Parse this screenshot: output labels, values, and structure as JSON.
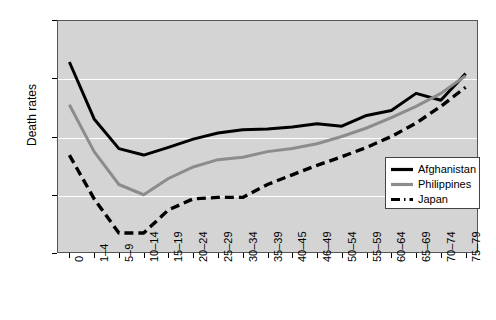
{
  "chart_data": {
    "type": "line",
    "title": "",
    "xlabel": "",
    "ylabel": "Death rates",
    "yscale": "log",
    "ylim": [
      0.1,
      1000
    ],
    "ytick_labels": [
      "1000",
      "100",
      "10",
      "1",
      "0.1"
    ],
    "ytick_values": [
      1000,
      100,
      10,
      1,
      0.1
    ],
    "grid": "horizontal",
    "legend_position": "lower right",
    "categories": [
      "0",
      "1–4",
      "5–9",
      "10–14",
      "15–19",
      "20–24",
      "25–29",
      "30–34",
      "35–39",
      "40–45",
      "46–49",
      "50–54",
      "55–59",
      "60–64",
      "65–69",
      "70–74",
      "75–79"
    ],
    "series": [
      {
        "name": "Afghanistan",
        "color": "#000000",
        "style": "solid",
        "values": [
          190,
          20,
          6.2,
          4.8,
          6.5,
          9.0,
          11.5,
          13.0,
          13.5,
          14.5,
          16.5,
          15.0,
          23.0,
          28.0,
          55.0,
          42.0,
          120.0
        ]
      },
      {
        "name": "Philippines",
        "color": "#8c8c8c",
        "style": "solid",
        "values": [
          35,
          5.5,
          1.5,
          1.0,
          1.9,
          3.0,
          4.0,
          4.4,
          5.5,
          6.2,
          7.5,
          10.0,
          14.0,
          21.0,
          33.0,
          55.0,
          110.0
        ]
      },
      {
        "name": "Japan",
        "color": "#000000",
        "style": "dashed",
        "values": [
          4.8,
          0.85,
          0.22,
          0.22,
          0.55,
          0.85,
          0.9,
          0.9,
          1.5,
          2.2,
          3.2,
          4.5,
          6.5,
          10.0,
          17.0,
          33.0,
          70.0
        ]
      }
    ]
  },
  "legend": {
    "entries": [
      {
        "label": "Afghanistan"
      },
      {
        "label": "Philippines"
      },
      {
        "label": "Japan"
      }
    ]
  }
}
